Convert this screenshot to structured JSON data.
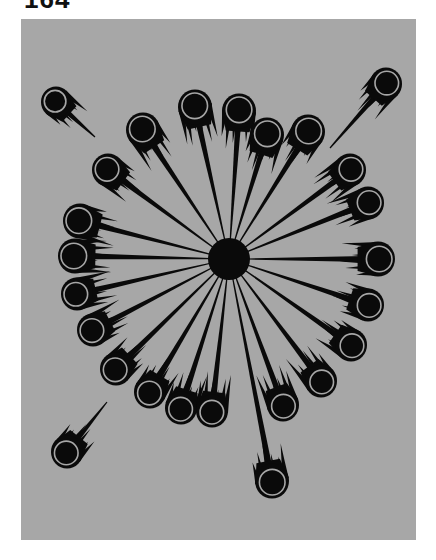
{
  "page": {
    "number_label": "164"
  },
  "illustration": {
    "background_color": "#a7a7a7",
    "ink_color": "#0a0a0a",
    "ring_color": "#a7a7a7",
    "center": {
      "x": 229,
      "y": 259,
      "r": 21
    },
    "comets": [
      {
        "x": 56,
        "y": 102,
        "r": 13,
        "tail_to": [
          95,
          137
        ],
        "reach_center": false
      },
      {
        "x": 386,
        "y": 84,
        "r": 14,
        "tail_to": [
          330,
          148
        ],
        "reach_center": false
      },
      {
        "x": 67,
        "y": 452,
        "r": 14,
        "tail_to": [
          107,
          402
        ],
        "reach_center": false
      },
      {
        "x": 272,
        "y": 481,
        "r": 15,
        "tail_to": [
          229,
          259
        ],
        "reach_center": true
      },
      {
        "x": 143,
        "y": 130,
        "r": 15,
        "tail_to": [
          229,
          259
        ],
        "reach_center": true
      },
      {
        "x": 195,
        "y": 107,
        "r": 15,
        "tail_to": [
          229,
          259
        ],
        "reach_center": true
      },
      {
        "x": 239,
        "y": 111,
        "r": 15,
        "tail_to": [
          229,
          259
        ],
        "reach_center": true
      },
      {
        "x": 267,
        "y": 135,
        "r": 15,
        "tail_to": [
          229,
          259
        ],
        "reach_center": true
      },
      {
        "x": 308,
        "y": 132,
        "r": 15,
        "tail_to": [
          229,
          259
        ],
        "reach_center": true
      },
      {
        "x": 108,
        "y": 170,
        "r": 14,
        "tail_to": [
          229,
          259
        ],
        "reach_center": true
      },
      {
        "x": 80,
        "y": 221,
        "r": 15,
        "tail_to": [
          229,
          259
        ],
        "reach_center": true
      },
      {
        "x": 75,
        "y": 256,
        "r": 15,
        "tail_to": [
          229,
          259
        ],
        "reach_center": true
      },
      {
        "x": 77,
        "y": 294,
        "r": 14,
        "tail_to": [
          229,
          259
        ],
        "reach_center": true
      },
      {
        "x": 93,
        "y": 330,
        "r": 14,
        "tail_to": [
          229,
          259
        ],
        "reach_center": true
      },
      {
        "x": 116,
        "y": 369,
        "r": 14,
        "tail_to": [
          229,
          259
        ],
        "reach_center": true
      },
      {
        "x": 150,
        "y": 392,
        "r": 14,
        "tail_to": [
          229,
          259
        ],
        "reach_center": true
      },
      {
        "x": 181,
        "y": 408,
        "r": 14,
        "tail_to": [
          229,
          259
        ],
        "reach_center": true
      },
      {
        "x": 212,
        "y": 411,
        "r": 14,
        "tail_to": [
          229,
          259
        ],
        "reach_center": true
      },
      {
        "x": 283,
        "y": 405,
        "r": 14,
        "tail_to": [
          229,
          259
        ],
        "reach_center": true
      },
      {
        "x": 321,
        "y": 381,
        "r": 14,
        "tail_to": [
          229,
          259
        ],
        "reach_center": true
      },
      {
        "x": 351,
        "y": 345,
        "r": 14,
        "tail_to": [
          229,
          259
        ],
        "reach_center": true
      },
      {
        "x": 368,
        "y": 305,
        "r": 14,
        "tail_to": [
          229,
          259
        ],
        "reach_center": true
      },
      {
        "x": 378,
        "y": 259,
        "r": 15,
        "tail_to": [
          229,
          259
        ],
        "reach_center": true
      },
      {
        "x": 368,
        "y": 203,
        "r": 14,
        "tail_to": [
          229,
          259
        ],
        "reach_center": true
      },
      {
        "x": 350,
        "y": 170,
        "r": 14,
        "tail_to": [
          229,
          259
        ],
        "reach_center": true
      }
    ]
  }
}
